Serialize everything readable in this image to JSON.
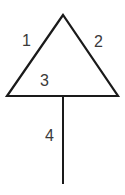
{
  "diagram": {
    "stroke_color": "#1a1a1a",
    "label_color": "#3a3a3a",
    "shapes": {
      "triangle": {
        "apex": [
          63,
          15
        ],
        "bottom_left": [
          7,
          96
        ],
        "bottom_right": [
          118,
          96
        ]
      },
      "stem": {
        "top": [
          63,
          96
        ],
        "bottom": [
          63,
          184
        ]
      }
    },
    "labels": [
      {
        "id": "1",
        "text": "1",
        "x": 22,
        "y": 33,
        "refers_to": "left side"
      },
      {
        "id": "2",
        "text": "2",
        "x": 94,
        "y": 34,
        "refers_to": "right side"
      },
      {
        "id": "3",
        "text": "3",
        "x": 40,
        "y": 73,
        "refers_to": "base"
      },
      {
        "id": "4",
        "text": "4",
        "x": 45,
        "y": 128,
        "refers_to": "stem"
      }
    ]
  }
}
